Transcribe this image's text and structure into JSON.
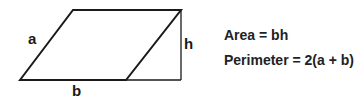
{
  "diagram": {
    "shape": "parallelogram",
    "labels": {
      "side": "a",
      "base": "b",
      "height": "h"
    },
    "formulas": {
      "area": "Area = bh",
      "perimeter": "Perimeter = 2(a + b)"
    },
    "stroke_color": "#1a1a1a"
  }
}
